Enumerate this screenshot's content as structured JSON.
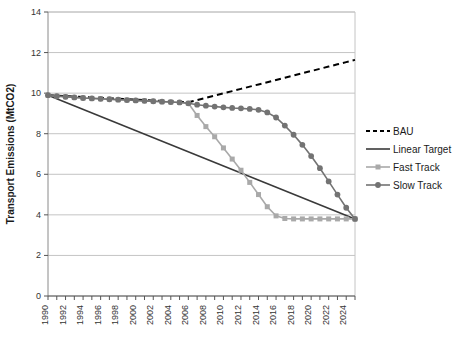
{
  "chart_data": {
    "type": "line",
    "title": "",
    "xlabel": "",
    "ylabel": "Transport Emissions (MtCO2)",
    "xlim": [
      1990,
      2025
    ],
    "ylim": [
      0,
      14
    ],
    "yticks": [
      0,
      2,
      4,
      6,
      8,
      10,
      12,
      14
    ],
    "ytick_labels": [
      "0",
      "2",
      "4",
      "6",
      "8",
      "10",
      "12",
      "14"
    ],
    "xticks": [
      1990,
      1991,
      1992,
      1993,
      1994,
      1995,
      1996,
      1997,
      1998,
      1999,
      2000,
      2001,
      2002,
      2003,
      2004,
      2005,
      2006,
      2007,
      2008,
      2009,
      2010,
      2011,
      2012,
      2013,
      2014,
      2015,
      2016,
      2017,
      2018,
      2019,
      2020,
      2021,
      2022,
      2023,
      2024,
      2025
    ],
    "xtick_labels": [
      "1990",
      "1992",
      "1994",
      "1996",
      "1998",
      "2000",
      "2002",
      "2004",
      "2006",
      "2008",
      "2010",
      "2012",
      "2014",
      "2016",
      "2018",
      "2020",
      "2022",
      "2024"
    ],
    "xtick_label_years": [
      1990,
      1992,
      1994,
      1996,
      1998,
      2000,
      2002,
      2004,
      2006,
      2008,
      2010,
      2012,
      2014,
      2016,
      2018,
      2020,
      2022,
      2024
    ],
    "xtick_label_rotation": -90,
    "grid": "horizontal",
    "legend_position": "right",
    "x": [
      1990,
      1991,
      1992,
      1993,
      1994,
      1995,
      1996,
      1997,
      1998,
      1999,
      2000,
      2001,
      2002,
      2003,
      2004,
      2005,
      2006,
      2007,
      2008,
      2009,
      2010,
      2011,
      2012,
      2013,
      2014,
      2015,
      2016,
      2017,
      2018,
      2019,
      2020,
      2021,
      2022,
      2023,
      2024,
      2025
    ],
    "series": [
      {
        "name": "BAU",
        "color": "#000000",
        "style": "dashed",
        "marker": "none",
        "x": [
          1990,
          2006,
          2007,
          2008,
          2009,
          2010,
          2011,
          2012,
          2013,
          2014,
          2015,
          2016,
          2017,
          2018,
          2019,
          2020,
          2021,
          2022,
          2023,
          2024,
          2025
        ],
        "values": [
          9.9,
          9.55,
          9.66,
          9.77,
          9.88,
          9.99,
          10.1,
          10.21,
          10.32,
          10.43,
          10.54,
          10.65,
          10.76,
          10.87,
          10.98,
          11.09,
          11.2,
          11.31,
          11.42,
          11.53,
          11.64
        ]
      },
      {
        "name": "Linear Target",
        "color": "#3a3a3a",
        "style": "solid",
        "marker": "none",
        "x": [
          1990,
          2025
        ],
        "values": [
          9.9,
          3.8
        ]
      },
      {
        "name": "Fast Track",
        "color": "#a9a9a9",
        "style": "solid",
        "marker": "square",
        "values": [
          9.9,
          9.85,
          9.82,
          9.79,
          9.76,
          9.74,
          9.72,
          9.7,
          9.68,
          9.66,
          9.64,
          9.62,
          9.6,
          9.58,
          9.56,
          9.54,
          9.5,
          8.9,
          8.35,
          7.85,
          7.3,
          6.75,
          6.2,
          5.6,
          5.0,
          4.4,
          3.95,
          3.82,
          3.8,
          3.8,
          3.8,
          3.8,
          3.8,
          3.8,
          3.8,
          3.8
        ]
      },
      {
        "name": "Slow Track",
        "color": "#737373",
        "style": "solid",
        "marker": "circle",
        "values": [
          9.9,
          9.85,
          9.82,
          9.79,
          9.76,
          9.74,
          9.72,
          9.7,
          9.68,
          9.66,
          9.64,
          9.62,
          9.6,
          9.58,
          9.56,
          9.54,
          9.5,
          9.43,
          9.38,
          9.34,
          9.3,
          9.27,
          9.25,
          9.22,
          9.18,
          9.05,
          8.8,
          8.4,
          7.95,
          7.45,
          6.9,
          6.3,
          5.65,
          5.0,
          4.35,
          3.8
        ]
      }
    ]
  },
  "legend": {
    "items": [
      {
        "label": "BAU"
      },
      {
        "label": "Linear Target"
      },
      {
        "label": "Fast Track"
      },
      {
        "label": "Slow Track"
      }
    ]
  }
}
